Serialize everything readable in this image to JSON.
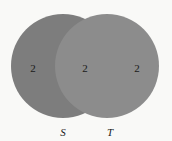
{
  "diagram": {
    "type": "venn",
    "sets": [
      {
        "name": "S",
        "label": "S",
        "color": "#7d7d7d"
      },
      {
        "name": "T",
        "label": "T",
        "color": "#8c8c8c"
      }
    ],
    "regions": {
      "s_only": "2",
      "intersection": "2",
      "t_only": "2"
    },
    "background": "#f9f9f7"
  }
}
